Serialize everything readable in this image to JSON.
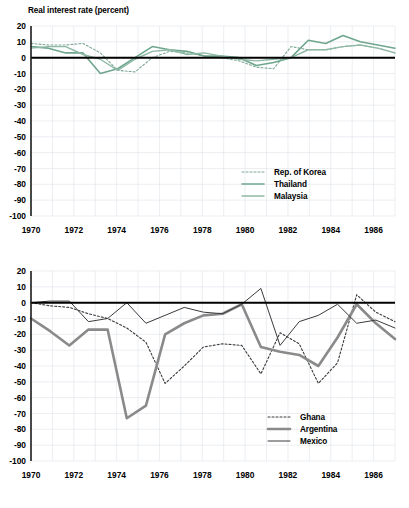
{
  "figure": {
    "title": "Real interest rate (percent)",
    "background": "#ffffff",
    "grid_color": "#dfe3ea",
    "axis_color": "#1c1c1c"
  },
  "chart_data": [
    {
      "id": "asia",
      "type": "line",
      "title": "Real interest rate (percent)",
      "xlabel": "",
      "ylabel": "",
      "xlim": [
        1970,
        1987
      ],
      "ylim": [
        -100,
        20
      ],
      "ytick_labels": [
        "20",
        "10",
        "0",
        "-10",
        "-20",
        "-30",
        "-40",
        "-50",
        "-60",
        "-70",
        "-80",
        "-90",
        "-100"
      ],
      "yticks": [
        20,
        10,
        0,
        -10,
        -20,
        -30,
        -40,
        -50,
        -60,
        -70,
        -80,
        -90,
        -100
      ],
      "xtick_labels": [
        "1970",
        "1972",
        "1974",
        "1976",
        "1978",
        "1980",
        "1982",
        "1984",
        "1986"
      ],
      "xticks": [
        1970,
        1972,
        1974,
        1976,
        1978,
        1980,
        1982,
        1984,
        1986
      ],
      "grid": true,
      "legend_position": "lower-right",
      "x": [
        1970,
        1971,
        1972,
        1973,
        1974,
        1975,
        1976,
        1977,
        1978,
        1979,
        1980,
        1981,
        1982,
        1983,
        1984,
        1985,
        1986,
        1987
      ],
      "series": [
        {
          "name": "Rep. of Korea",
          "style": "dotted",
          "color": "#7da896",
          "width": 1.1,
          "values": [
            9,
            8,
            8,
            9,
            3,
            -8,
            -9,
            0,
            4,
            3,
            1,
            0,
            -2,
            -6,
            -7,
            7,
            5,
            5,
            7,
            8,
            6,
            3
          ]
        },
        {
          "name": "Thailand",
          "style": "solid",
          "color": "#6fa68d",
          "width": 1.6,
          "values": [
            7,
            6,
            3,
            3,
            -10,
            -7,
            0,
            7,
            5,
            4,
            1,
            1,
            0,
            -5,
            -3,
            0,
            11,
            9,
            14,
            10,
            8,
            6
          ]
        },
        {
          "name": "Malaysia",
          "style": "solid",
          "color": "#8fb9a6",
          "width": 1.4,
          "values": [
            6,
            7,
            7,
            2,
            -1,
            -8,
            -1,
            4,
            5,
            2,
            3,
            1,
            -1,
            -2,
            -1,
            0,
            5,
            5,
            7,
            8,
            6,
            3
          ]
        }
      ]
    },
    {
      "id": "latam-africa",
      "type": "line",
      "title": "",
      "xlabel": "",
      "ylabel": "",
      "xlim": [
        1970,
        1987
      ],
      "ylim": [
        -100,
        20
      ],
      "ytick_labels": [
        "20",
        "10",
        "0",
        "-10",
        "-20",
        "-30",
        "-40",
        "-50",
        "-60",
        "-70",
        "-80",
        "-90",
        "-100"
      ],
      "yticks": [
        20,
        10,
        0,
        -10,
        -20,
        -30,
        -40,
        -50,
        -60,
        -70,
        -80,
        -90,
        -100
      ],
      "xtick_labels": [
        "1970",
        "1972",
        "1974",
        "1976",
        "1978",
        "1980",
        "1982",
        "1984",
        "1986"
      ],
      "xticks": [
        1970,
        1972,
        1974,
        1976,
        1978,
        1980,
        1982,
        1984,
        1986
      ],
      "grid": true,
      "legend_position": "lower-right",
      "x": [
        1970,
        1971,
        1972,
        1973,
        1974,
        1975,
        1976,
        1977,
        1978,
        1979,
        1980,
        1981,
        1982,
        1983,
        1984,
        1985,
        1986,
        1987
      ],
      "series": [
        {
          "name": "Ghana",
          "style": "dotted",
          "color": "#3b3b3b",
          "width": 1.1,
          "values": [
            0,
            -2,
            -3,
            -7,
            -10,
            -16,
            -25,
            -51,
            -40,
            -28,
            -26,
            -27,
            -45,
            -19,
            -26,
            -51,
            -38,
            5,
            -6,
            -12
          ]
        },
        {
          "name": "Argentina",
          "style": "solid-thick",
          "color": "#8a8a8a",
          "width": 2.6,
          "values": [
            -10,
            -18,
            -27,
            -17,
            -17,
            -73,
            -65,
            -20,
            -13,
            -8,
            -7,
            -1,
            -28,
            -31,
            -33,
            -40,
            -22,
            -1,
            -13,
            -23
          ]
        },
        {
          "name": "Mexico",
          "style": "solid-thin",
          "color": "#3b3b3b",
          "width": 1.0,
          "values": [
            0,
            1,
            1,
            -12,
            -10,
            0,
            -13,
            -8,
            -3,
            -6,
            -7,
            -1,
            9,
            -27,
            -12,
            -8,
            -1,
            -13,
            -11,
            -16
          ]
        }
      ]
    }
  ],
  "legends": {
    "top": [
      {
        "label": "Rep. of Korea",
        "style": "dotted"
      },
      {
        "label": "Thailand",
        "style": "solid"
      },
      {
        "label": "Malaysia",
        "style": "solid"
      }
    ],
    "bottom": [
      {
        "label": "Ghana",
        "style": "dotted"
      },
      {
        "label": "Argentina",
        "style": "solid-thick"
      },
      {
        "label": "Mexico",
        "style": "solid-thin"
      }
    ]
  }
}
